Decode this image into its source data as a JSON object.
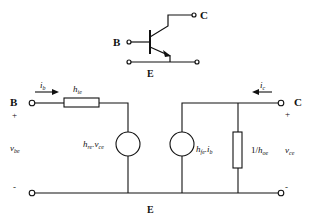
{
  "transistor": {
    "base_label": "B",
    "collector_label": "C",
    "emitter_label": "E"
  },
  "circuit": {
    "input_terminal_label": "B",
    "output_terminal_label": "C",
    "common_label": "E",
    "input_current": "i",
    "input_current_sub": "b",
    "output_current": "i",
    "output_current_sub": "c",
    "input_plus": "+",
    "input_minus": "-",
    "output_plus": "+",
    "output_minus": "-",
    "input_voltage": "v",
    "input_voltage_sub": "be",
    "output_voltage": "v",
    "output_voltage_sub": "ce",
    "resistor_hie": "h",
    "resistor_hie_sub": "ie",
    "source_hre": "h",
    "source_hre_sub": "re",
    "source_hre_mult": ".v",
    "source_hre_mult_sub": "ce",
    "source_hfe": "h",
    "source_hfe_sub": "fe",
    "source_hfe_mult": ".i",
    "source_hfe_mult_sub": "b",
    "resistor_hoe_prefix": "1/",
    "resistor_hoe": "h",
    "resistor_hoe_sub": "oe"
  },
  "colors": {
    "line": "#111111",
    "background": "#ffffff"
  }
}
